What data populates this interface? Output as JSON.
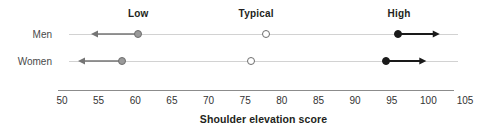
{
  "chart_data": {
    "type": "scatter",
    "title": "",
    "xlabel": "Shoulder elevation score",
    "ylabel": "",
    "xlim": [
      50,
      105
    ],
    "ticks": [
      50,
      55,
      60,
      65,
      70,
      75,
      80,
      85,
      90,
      95,
      100,
      105
    ],
    "grid": false,
    "legend_position": "top",
    "band_headers": [
      {
        "label": "Low",
        "x": 60.4
      },
      {
        "label": "Typical",
        "x": 76.5
      },
      {
        "label": "High",
        "x": 96.0
      }
    ],
    "categories": [
      "Men",
      "Women"
    ],
    "series": [
      {
        "name": "Low cutoff",
        "marker": "grey-filled-circle",
        "values": [
          60.4,
          58.2
        ],
        "direction": "left"
      },
      {
        "name": "Typical",
        "marker": "open-circle",
        "values": [
          77.8,
          75.8
        ],
        "direction": "none"
      },
      {
        "name": "High cutoff",
        "marker": "black-filled-circle",
        "values": [
          95.8,
          94.2
        ],
        "direction": "right"
      }
    ],
    "rows": [
      {
        "label": "Men",
        "low": {
          "value": 60.4,
          "arrow_to": 54.0
        },
        "typical": {
          "value": 77.8
        },
        "high": {
          "value": 95.8,
          "arrow_to": 101.5
        },
        "line_from": 51.0,
        "line_to": 104.0
      },
      {
        "label": "Women",
        "low": {
          "value": 58.2,
          "arrow_to": 52.2
        },
        "typical": {
          "value": 75.8
        },
        "high": {
          "value": 94.2,
          "arrow_to": 99.7
        },
        "line_from": 51.0,
        "line_to": 104.0
      }
    ],
    "colors": {
      "low_marker": "#9a9a9a",
      "low_marker_edge": "#6e6e6e",
      "typical_marker": "#ffffff",
      "typical_marker_edge": "#6e6e6e",
      "high_marker": "#1a1a1a",
      "row_rule": "#d2d2d2",
      "axis": "#8c8c8c",
      "low_arrow": "#757575",
      "high_arrow": "#1a1a1a",
      "text": "#231f20"
    }
  }
}
